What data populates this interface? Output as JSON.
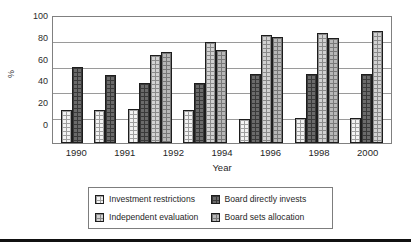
{
  "chart_data": {
    "type": "bar",
    "title": "",
    "xlabel": "Year",
    "ylabel": "%",
    "ylim": [
      0,
      100
    ],
    "yticks": [
      0,
      20,
      40,
      60,
      80,
      100
    ],
    "grid": true,
    "legend_position": "bottom",
    "categories": [
      "1990",
      "1991",
      "1992",
      "1994",
      "1996",
      "1998",
      "2000"
    ],
    "series": [
      {
        "name": "Investment restrictions",
        "color": "#f3f3f3",
        "values": [
          26,
          26,
          27,
          26,
          19,
          20,
          20
        ]
      },
      {
        "name": "Board directly invests",
        "color": "#6b6b6b",
        "values": [
          60,
          54,
          48,
          48,
          55,
          55,
          55
        ]
      },
      {
        "name": "Independent evaluation",
        "color": "#d2d2d2",
        "values": [
          null,
          null,
          70,
          80,
          86,
          87,
          89
        ]
      },
      {
        "name": "Board sets allocation",
        "color": "#b8b8b8",
        "values": [
          null,
          null,
          72,
          74,
          84,
          83,
          null
        ]
      }
    ]
  },
  "axis": {
    "y_label": "%",
    "x_label": "Year",
    "y_ticks": [
      "100",
      "80",
      "60",
      "40",
      "20",
      "0"
    ],
    "x_ticks": [
      "1990",
      "1991",
      "1992",
      "1994",
      "1996",
      "1998",
      "2000"
    ]
  },
  "legend": {
    "items": [
      {
        "label": "Investment restrictions",
        "swatch": "s0"
      },
      {
        "label": "Board directly invests",
        "swatch": "s1"
      },
      {
        "label": "Independent evaluation",
        "swatch": "s2"
      },
      {
        "label": "Board sets allocation",
        "swatch": "s3"
      }
    ]
  }
}
